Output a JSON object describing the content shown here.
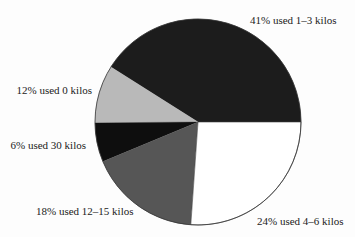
{
  "chart_data": {
    "type": "pie",
    "title": "",
    "unit": "%",
    "start_angle_deg": 0,
    "direction": "counterclockwise",
    "slices": [
      {
        "label": "41% used 1–3 kilos",
        "category": "1–3 kilos",
        "value": 41,
        "color": "#1c1c1c",
        "start_deg": 0,
        "end_deg": 147.7,
        "label_x": 250,
        "label_y": 24,
        "label_anchor": "start"
      },
      {
        "label": "12% used 0 kilos",
        "category": "0 kilos",
        "value": 12,
        "color": "#b9b9b9",
        "start_deg": 147.7,
        "end_deg": 180.5,
        "label_x": 92,
        "label_y": 94,
        "label_anchor": "end"
      },
      {
        "label": "6% used 30 kilos",
        "category": "30 kilos",
        "value": 6,
        "color": "#0e0e0e",
        "start_deg": 180.5,
        "end_deg": 202.6,
        "label_x": 86,
        "label_y": 149,
        "label_anchor": "end"
      },
      {
        "label": "18% used 12–15 kilos",
        "category": "12–15 kilos",
        "value": 18,
        "color": "#565656",
        "start_deg": 202.6,
        "end_deg": 266.0,
        "label_x": 36,
        "label_y": 215,
        "label_anchor": "start"
      },
      {
        "label": "24% used 4–6 kilos",
        "category": "4–6 kilos",
        "value": 24,
        "color": "#ffffff",
        "start_deg": 266.0,
        "end_deg": 360,
        "label_x": 257,
        "label_y": 225,
        "label_anchor": "start"
      }
    ],
    "geometry": {
      "cx": 198,
      "cy": 122,
      "r": 103
    },
    "legend": "none (direct labels)"
  }
}
